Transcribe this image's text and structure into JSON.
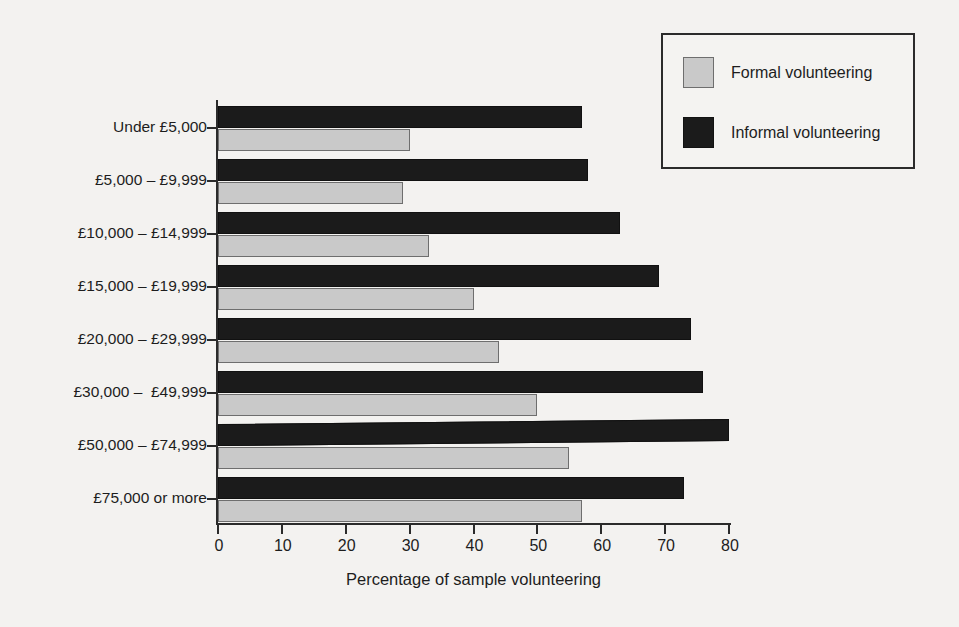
{
  "chart_data": {
    "type": "bar",
    "orientation": "horizontal",
    "title": "",
    "xlabel": "Percentage of sample volunteering",
    "ylabel": "",
    "xlim": [
      0,
      80
    ],
    "xticks": [
      0,
      10,
      20,
      30,
      40,
      50,
      60,
      70,
      80
    ],
    "xtick_labels": [
      "0",
      "10",
      "20",
      "30",
      "40",
      "50",
      "60",
      "70",
      "80"
    ],
    "grid": false,
    "legend_position": "top-right",
    "categories": [
      "Under £5,000",
      "£5,000 – £9,999",
      "£10,000 – £14,999",
      "£15,000 – £19,999",
      "£20,000 – £29,999",
      "£30,000 –  £49,999",
      "£50,000 – £74,999",
      "£75,000 or more"
    ],
    "series": [
      {
        "name": "Formal volunteering",
        "color": "#c9c9c9",
        "values": [
          30,
          29,
          33,
          40,
          44,
          50,
          55,
          57
        ]
      },
      {
        "name": "Informal volunteering",
        "color": "#1b1b1b",
        "values": [
          57,
          58,
          63,
          69,
          74,
          76,
          80,
          73
        ]
      }
    ]
  },
  "legend": {
    "items": [
      {
        "label": "Formal volunteering",
        "swatch": "formal"
      },
      {
        "label": "Informal volunteering",
        "swatch": "informal"
      }
    ]
  },
  "axes": {
    "x_title": "Percentage of sample volunteering"
  }
}
